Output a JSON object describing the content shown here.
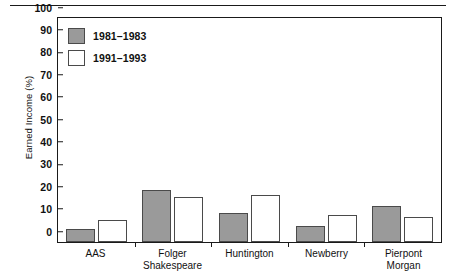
{
  "chart_data": {
    "type": "bar",
    "title": "",
    "xlabel": "",
    "ylabel": "Earned Income (%)",
    "ylim": [
      0,
      100
    ],
    "yticks": [
      100,
      90,
      80,
      70,
      60,
      50,
      40,
      30,
      20,
      10,
      0
    ],
    "grid": false,
    "legend_position": "top-left",
    "categories": [
      "AAS",
      "Folger\nShakespeare",
      "Huntington",
      "Newberry",
      "Pierpont\nMorgan"
    ],
    "series": [
      {
        "name": "1981–1983",
        "color": "#9a9a9a",
        "values": [
          6,
          23,
          13,
          7,
          16
        ]
      },
      {
        "name": "1991–1993",
        "color": "#ffffff",
        "values": [
          10,
          20,
          21,
          12,
          11
        ]
      }
    ]
  }
}
